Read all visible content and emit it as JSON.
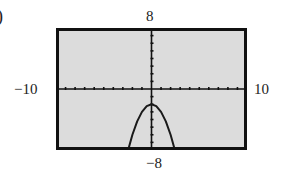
{
  "label_paren": ")",
  "chart_data": {
    "type": "line",
    "title": "",
    "xlabel": "",
    "ylabel": "",
    "xlim": [
      -10,
      10
    ],
    "ylim": [
      -8,
      8
    ],
    "xticks_step": 1,
    "yticks_step": 1,
    "window_labels": {
      "xmin": "−10",
      "xmax": "10",
      "ymin": "−8",
      "ymax": "8"
    },
    "series": [
      {
        "name": "parabola",
        "x": [
          -2.5,
          -2,
          -1.5,
          -1,
          -0.5,
          0,
          0.5,
          1,
          1.5,
          2,
          2.5
        ],
        "y": [
          -8.25,
          -6,
          -4.25,
          -3,
          -2.25,
          -2,
          -2.25,
          -3,
          -4.25,
          -6,
          -8.25
        ]
      }
    ],
    "grid": false,
    "background": "#dcdcdc",
    "line_color": "#1a1a1a"
  }
}
